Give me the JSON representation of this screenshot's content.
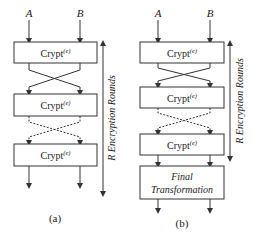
{
  "diagram_a": {
    "caption": "(a)",
    "input_left": "A",
    "input_right": "B",
    "block_label": "Crypt",
    "block_superscript": "(e)",
    "rounds_label": "R Encryption Rounds",
    "blocks": [
      {
        "label": "Crypt",
        "sup": "(e)"
      },
      {
        "label": "Crypt",
        "sup": "(e)"
      },
      {
        "label": "Crypt",
        "sup": "(e)"
      }
    ]
  },
  "diagram_b": {
    "caption": "(b)",
    "input_left": "A",
    "input_right": "B",
    "block_label": "Crypt",
    "block_superscript": "(e)",
    "rounds_label": "R Encryption Rounds",
    "blocks": [
      {
        "label": "Crypt",
        "sup": "(e)"
      },
      {
        "label": "Crypt",
        "sup": "(e)"
      },
      {
        "label": "Crypt",
        "sup": "(e)"
      }
    ],
    "final_line1": "Final",
    "final_line2": "Transformation"
  },
  "colors": {
    "stroke": "#333333",
    "background": "#ffffff"
  }
}
